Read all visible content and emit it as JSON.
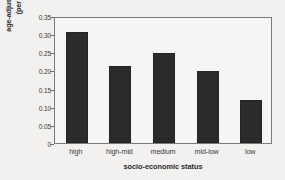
{
  "chart_data": {
    "type": "bar",
    "title": "",
    "subtitle": "",
    "xlabel": "socio-economic status",
    "ylabel": "age-adjusted incidence (per 100,000)",
    "ylabel_lines": [
      "age-adjusted incidence",
      "(per 100,000)"
    ],
    "categories": [
      "high",
      "high-mid",
      "medium",
      "mid-low",
      "low"
    ],
    "values": [
      0.305,
      0.213,
      0.248,
      0.199,
      0.119
    ],
    "series": [
      {
        "name": "age-adjusted incidence",
        "values": [
          0.305,
          0.213,
          0.248,
          0.199,
          0.119
        ]
      }
    ],
    "ylim": [
      0,
      0.35
    ],
    "xlim_categories": 5,
    "ytick_labels": [
      "0.35",
      "0.30",
      "0.25",
      "0.20",
      "0.15",
      "0.10",
      "0.05",
      "0"
    ],
    "ytick_values": [
      0.35,
      0.3,
      0.25,
      0.2,
      0.15,
      0.1,
      0.05,
      0
    ],
    "grid": false,
    "legend": false,
    "legend_position": "none",
    "bar_color": "#2b2b2b",
    "axis_color": "#7a7a7a",
    "plot_background": "#f6f5f3",
    "figure_background": "#f2f1ef",
    "annotations": []
  }
}
